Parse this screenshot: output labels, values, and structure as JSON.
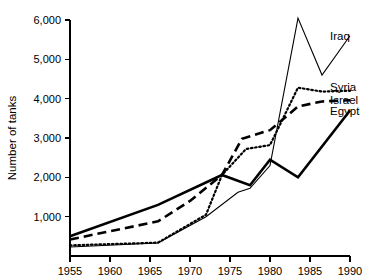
{
  "chart_data": {
    "type": "line",
    "title": "",
    "xlabel": "",
    "ylabel": "Number of tanks",
    "xlim": [
      1955,
      1990
    ],
    "ylim": [
      0,
      6000
    ],
    "grid": false,
    "legend_position": "right-inline",
    "x_ticks": [
      1955,
      1960,
      1965,
      1970,
      1975,
      1980,
      1985,
      1990
    ],
    "x_tick_labels": [
      "1955",
      "1960",
      "1965",
      "1970",
      "1975",
      "1980",
      "1985",
      "1990"
    ],
    "y_ticks": [
      1000,
      2000,
      3000,
      4000,
      5000,
      6000
    ],
    "y_tick_labels": [
      "1,000",
      "2,000",
      "3,000",
      "4,000",
      "5,000",
      "6,000"
    ],
    "series": [
      {
        "name": "Egypt",
        "style": "solid-thick",
        "label": "Egypt",
        "label_y_value": 3650,
        "x": [
          1955,
          1966,
          1974,
          1977.5,
          1980,
          1983.5,
          1990
        ],
        "values": [
          500,
          1300,
          2060,
          1800,
          2450,
          2000,
          3700
        ]
      },
      {
        "name": "Israel",
        "style": "dashed",
        "label": "Israel",
        "label_y_value": 3950,
        "x": [
          1955,
          1966,
          1970,
          1974,
          1976.5,
          1980,
          1983.5,
          1986.5,
          1990
        ],
        "values": [
          420,
          880,
          1400,
          2060,
          2980,
          3200,
          3800,
          3930,
          3960
        ]
      },
      {
        "name": "Syria",
        "style": "dotted",
        "label": "Syria",
        "label_y_value": 4260,
        "x": [
          1955,
          1966,
          1972,
          1974,
          1977,
          1980,
          1983.5,
          1986.5,
          1990
        ],
        "values": [
          270,
          340,
          1050,
          2060,
          2720,
          2820,
          4280,
          4180,
          4200
        ]
      },
      {
        "name": "Iraq",
        "style": "solid-thin",
        "label": "Iraq",
        "label_y_value": 5580,
        "x": [
          1955,
          1966,
          1972,
          1976,
          1977.5,
          1980,
          1983.5,
          1986.5,
          1990
        ],
        "values": [
          230,
          330,
          1000,
          1620,
          1720,
          2300,
          6050,
          4600,
          5600
        ]
      }
    ]
  },
  "geometry": {
    "x_pixel_start": 70,
    "x_pixel_end": 350,
    "y_pixel_zero": 256,
    "y_pixel_top": 20
  }
}
